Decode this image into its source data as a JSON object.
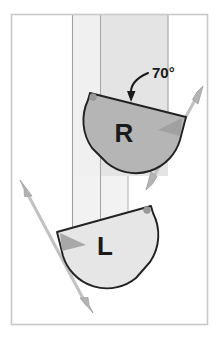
{
  "figure": {
    "title": "",
    "background_color": "#ffffff",
    "frame": {
      "name": "figure-border",
      "stroke_color": "#c8c8c8",
      "x": 11,
      "y": 14,
      "width": 197,
      "height": 311
    },
    "bands": [
      {
        "name": "band-left-light",
        "color": "#f0f0f0",
        "x": 72,
        "y": 15,
        "width": 28,
        "height": 260
      },
      {
        "name": "band-center-gray",
        "color": "#e4e4e4",
        "x": 100,
        "y": 15,
        "width": 68,
        "height": 160
      },
      {
        "name": "band-lower-light",
        "color": "#f2f2f2",
        "x": 72,
        "y": 175,
        "width": 56,
        "height": 70
      }
    ],
    "band_edge_color": "#a9a9a9",
    "shapes": [
      {
        "id": "shape-r",
        "label": "R",
        "fill_color": "#b5b5b5",
        "stroke_color": "#222222",
        "label_x": 124,
        "label_y": 140,
        "label_size": 26,
        "marker_dot": {
          "name": "corner-dot-r",
          "cx": 92,
          "cy": 96,
          "r": 3.2,
          "color": "#9a9a9a"
        },
        "wedge_color": "#9c9c9c"
      },
      {
        "id": "shape-l",
        "label": "L",
        "fill_color": "#e6e6e6",
        "stroke_color": "#222222",
        "label_x": 104,
        "label_y": 253,
        "label_size": 26,
        "marker_dot": {
          "name": "corner-dot-l",
          "cx": 147,
          "cy": 209,
          "r": 3.2,
          "color": "#9a9a9a"
        },
        "wedge_color": "#9c9c9c"
      }
    ],
    "annotation": {
      "name": "angle-annotation",
      "text": "70°",
      "value": 70,
      "unit": "degrees",
      "text_x": 157,
      "text_y": 76,
      "text_size": 14,
      "leader_color": "#1a1a1a"
    },
    "arrows": [
      {
        "name": "axis-arrow-right",
        "description": "double-headed orientation axis through R",
        "x1": 202,
        "y1": 90,
        "x2": 147,
        "y2": 188,
        "color": "#bfbfbf",
        "stroke": "#9a9a9a",
        "double_headed": true
      },
      {
        "name": "axis-arrow-left",
        "description": "double-headed orientation axis through L",
        "x1": 20,
        "y1": 184,
        "x2": 92,
        "y2": 312,
        "color": "#bfbfbf",
        "stroke": "#9a9a9a",
        "double_headed": true
      }
    ]
  }
}
